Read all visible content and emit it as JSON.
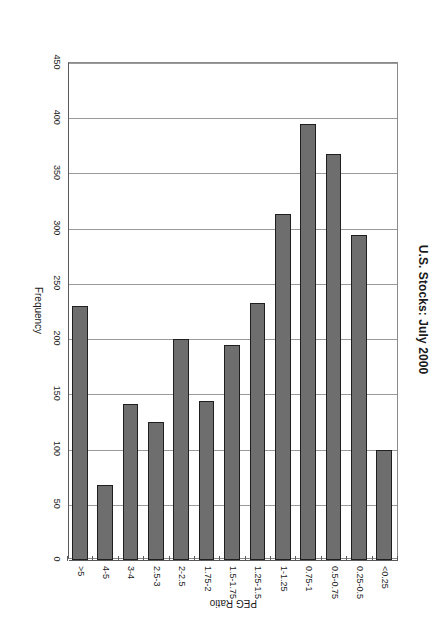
{
  "chart_data": {
    "type": "bar",
    "orientation": "horizontal",
    "title": "U.S. Stocks: July 2000",
    "xlabel": "PEG Ratio",
    "ylabel": "Frequency",
    "categories": [
      "<0.25",
      "0.25-0.5",
      "0.5-0.75",
      "0.75-1",
      "1-1.25",
      "1.25-1.5",
      "1.5-1.75",
      "1.75-2",
      "2-2.5",
      "2.5-3",
      "3-4",
      "4-5",
      ">5"
    ],
    "values": [
      100,
      294,
      368,
      395,
      313,
      233,
      195,
      144,
      200,
      125,
      141,
      68,
      230
    ],
    "ylim": [
      0,
      450
    ],
    "ytick_labels": [
      "0",
      "50",
      "100",
      "150",
      "200",
      "250",
      "300",
      "350",
      "400",
      "450"
    ],
    "ytick_values": [
      0,
      50,
      100,
      150,
      200,
      250,
      300,
      350,
      400,
      450
    ],
    "grid": "vertical-value-gridlines",
    "legend": "none",
    "bar_color": "#6e6e6e",
    "bar_border_color": "#1f1f1f",
    "gridline_color": "#9a9a9a",
    "axis_color": "#5a5a5a"
  }
}
